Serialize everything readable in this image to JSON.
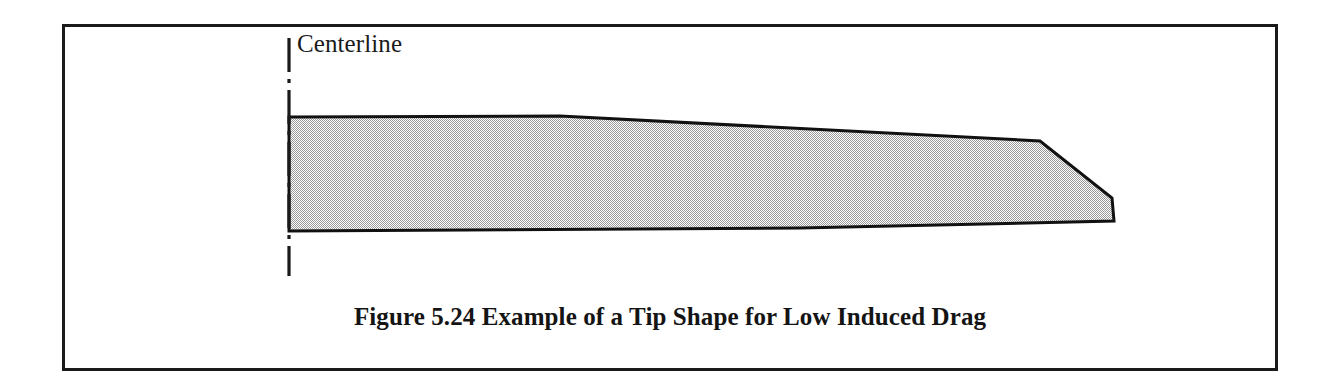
{
  "figure": {
    "caption": "Figure 5.24 Example of a Tip Shape for Low Induced Drag",
    "centerline_label": "Centerline",
    "frame": {
      "x": 62,
      "y": 24,
      "width": 1216,
      "height": 347,
      "border_color": "#1a1a1a",
      "border_width": 3
    }
  },
  "colors": {
    "ink": "#1a1a1a",
    "outline": "#111111",
    "wing_fill": "#d2d2d2",
    "page_background": "#ffffff"
  },
  "chart_data": {
    "type": "diagram",
    "title": "Figure 5.24 Example of a Tip Shape for Low Induced Drag",
    "annotations": [
      "Centerline"
    ],
    "centerline": {
      "label": "Centerline",
      "x": 289,
      "y_top": 38,
      "y_bottom": 276,
      "style": "dash-dot",
      "dash_pattern": "34 7 4 7"
    },
    "wing_planform": {
      "fill": "#d2d2d2",
      "stroke": "#111111",
      "stroke_width": 3,
      "vertices": [
        {
          "name": "root-leading-edge",
          "x": 289,
          "y": 117
        },
        {
          "name": "leading-edge-break",
          "x": 560,
          "y": 116
        },
        {
          "name": "tip-leading-edge-break",
          "x": 1040,
          "y": 141
        },
        {
          "name": "tip-leading-corner",
          "x": 1112,
          "y": 198
        },
        {
          "name": "tip-trailing-corner",
          "x": 1114,
          "y": 221
        },
        {
          "name": "trailing-edge-mid",
          "x": 800,
          "y": 228
        },
        {
          "name": "root-trailing-edge",
          "x": 289,
          "y": 231
        }
      ],
      "root_chord_px": 114,
      "tip_chord_px": 23,
      "semi_span_px": 825
    }
  }
}
